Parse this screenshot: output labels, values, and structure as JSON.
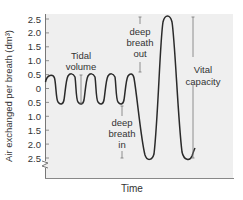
{
  "chart_data": {
    "type": "line",
    "title": "",
    "xlabel": "Time",
    "ylabel": "Air exchanged per breath (dm³)",
    "ylim": [
      -2.5,
      2.5
    ],
    "ytick_labels": [
      "2.5",
      "2.0",
      "1.5",
      "1.0",
      "0.5",
      "0",
      "0.5",
      "1.0",
      "1.5",
      "2.0",
      "2.5"
    ],
    "ytick_values": [
      2.5,
      2.0,
      1.5,
      1.0,
      0.5,
      0,
      -0.5,
      -1.0,
      -1.5,
      -2.0,
      -2.5
    ],
    "grid": false,
    "legend": null,
    "series": [
      {
        "name": "Breathing trace",
        "description": "Five tidal breaths oscillating between +0.5 and -0.5, then a deep breath in to -2.4, a deep breath out to +2.5, and back to -2.4",
        "x": [
          0,
          1,
          2,
          3,
          4,
          5,
          6,
          7,
          8,
          9,
          10,
          11,
          12,
          13,
          14,
          15
        ],
        "values": [
          0.2,
          0.5,
          -0.5,
          0.5,
          -0.5,
          0.5,
          -0.5,
          0.5,
          -0.5,
          0.5,
          -0.5,
          0.5,
          -2.4,
          2.5,
          -2.4,
          -2.2
        ]
      }
    ],
    "annotations": [
      {
        "text_lines": [
          "Tidal",
          "volume"
        ],
        "range": [
          0.5,
          -0.5
        ]
      },
      {
        "text_lines": [
          "deep",
          "breath",
          "in"
        ],
        "range": [
          -0.5,
          -2.4
        ]
      },
      {
        "text_lines": [
          "deep",
          "breath",
          "out"
        ],
        "range": [
          2.5,
          0.5
        ]
      },
      {
        "text_lines": [
          "Vital",
          "capacity"
        ],
        "range": [
          2.5,
          -2.4
        ]
      }
    ],
    "axis_break": "y-axis below 2.5"
  },
  "colors": {
    "plot_background": "#efefef",
    "line": "#333333",
    "axis": "#777777",
    "text": "#333333"
  }
}
